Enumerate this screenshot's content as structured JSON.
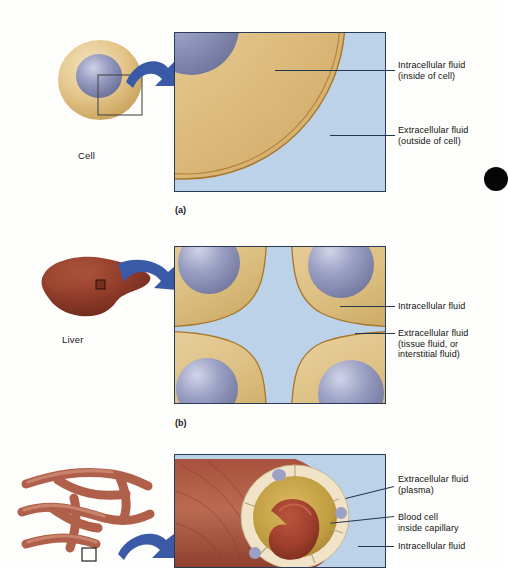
{
  "figure": {
    "background_color": "#fdfdfb"
  },
  "palette": {
    "cytoplasm_tan": "#e3c489",
    "cytoplasm_tan_light": "#f0dcb2",
    "cytoplasm_tan_dark": "#cba862",
    "membrane_line": "#a9762a",
    "nucleus_blue": "#8d92b8",
    "nucleus_blue_light": "#c3c7de",
    "nucleus_blue_dark": "#6a6f99",
    "extracellular_blue": "#b9cfe6",
    "extracellular_blue_light": "#cfe0f0",
    "arrow_blue": "#3a5aa8",
    "liver_brown": "#8e3b2a",
    "liver_brown_light": "#b4563c",
    "liver_brown_dark": "#6b2a1d",
    "capillary_red": "#b05a45",
    "capillary_red_light": "#c87a62",
    "vessel_wall_cream": "#f0e3c8",
    "plasma_gold": "#c8a44a",
    "blood_cell_red": "#a8412e",
    "box_border": "#2a3b57",
    "leader_line": "#23374f",
    "text_color": "#111111",
    "scan_artifact": "#060606"
  },
  "panels": [
    {
      "id": "a",
      "caption": "(a)",
      "source_label": "Cell",
      "callouts": [
        {
          "id": "a-intracellular",
          "text": "Intracellular fluid\n(inside of cell)"
        },
        {
          "id": "a-extracellular",
          "text": "Extracellular fluid\n(outside of cell)"
        }
      ]
    },
    {
      "id": "b",
      "caption": "(b)",
      "source_label": "Liver",
      "callouts": [
        {
          "id": "b-intracellular",
          "text": "Intracellular fluid"
        },
        {
          "id": "b-extracellular",
          "text": "Extracellular fluid\n(tissue fluid, or\ninterstitial fluid)"
        }
      ]
    },
    {
      "id": "c",
      "caption": "",
      "source_label": "",
      "callouts": [
        {
          "id": "c-extracellular",
          "text": "Extracellular fluid\n(plasma)"
        },
        {
          "id": "c-bloodcell",
          "text": "Blood cell\ninside capillary"
        },
        {
          "id": "c-intracellular",
          "text": "Intracellular fluid"
        }
      ]
    }
  ]
}
